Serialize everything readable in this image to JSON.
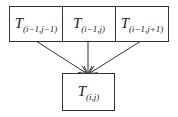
{
  "diagram": {
    "top_row": [
      {
        "symbol": "T",
        "subscript": "(i−1,j−1)"
      },
      {
        "symbol": "T",
        "subscript": "(i−1,j)"
      },
      {
        "symbol": "T",
        "subscript": "(i−1,j+1)"
      }
    ],
    "bottom": {
      "symbol": "T",
      "subscript": "(i,j)"
    },
    "line_color": "#333333"
  }
}
